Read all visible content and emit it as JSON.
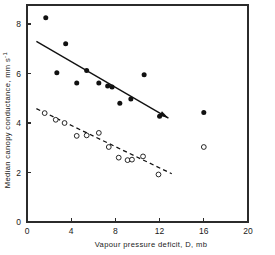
{
  "chart_data": {
    "type": "scatter",
    "title": "",
    "xlabel": "Vapour pressure deficit, D, mb",
    "ylabel": "Median canopy conductance, mm s⁻¹",
    "xlim": [
      0,
      20
    ],
    "ylim": [
      0,
      9
    ],
    "xticks": [
      0,
      4,
      8,
      12,
      16,
      20
    ],
    "xticklabels": [
      "0",
      "4",
      "8",
      "12",
      "16",
      "20"
    ],
    "yticks": [
      0,
      2,
      4,
      6,
      8
    ],
    "yticklabels": [
      "0",
      "2",
      "4",
      "6",
      "8"
    ],
    "grid": false,
    "legend": "none",
    "series": [
      {
        "name": "filled-circles",
        "marker": "filled-circle",
        "color": "#111111",
        "points": [
          {
            "x": 1.7,
            "y": 8.25
          },
          {
            "x": 2.7,
            "y": 6.03
          },
          {
            "x": 3.5,
            "y": 7.2
          },
          {
            "x": 4.5,
            "y": 5.62
          },
          {
            "x": 5.4,
            "y": 6.12
          },
          {
            "x": 6.5,
            "y": 5.62
          },
          {
            "x": 7.3,
            "y": 5.5
          },
          {
            "x": 7.7,
            "y": 5.45
          },
          {
            "x": 8.4,
            "y": 4.8
          },
          {
            "x": 9.4,
            "y": 4.97
          },
          {
            "x": 10.6,
            "y": 5.95
          },
          {
            "x": 12.0,
            "y": 4.27
          },
          {
            "x": 16.0,
            "y": 4.42
          }
        ],
        "fit_line": {
          "style": "solid",
          "x_start": 0.85,
          "y_start": 7.3,
          "x_end": 12.8,
          "y_end": 4.2
        }
      },
      {
        "name": "open-circles",
        "marker": "open-circle",
        "color": "#111111",
        "points": [
          {
            "x": 1.6,
            "y": 4.4
          },
          {
            "x": 2.6,
            "y": 4.13
          },
          {
            "x": 3.4,
            "y": 4.0
          },
          {
            "x": 4.5,
            "y": 3.48
          },
          {
            "x": 5.4,
            "y": 3.5
          },
          {
            "x": 6.5,
            "y": 3.6
          },
          {
            "x": 7.4,
            "y": 3.03
          },
          {
            "x": 8.3,
            "y": 2.6
          },
          {
            "x": 9.1,
            "y": 2.5
          },
          {
            "x": 9.5,
            "y": 2.52
          },
          {
            "x": 10.5,
            "y": 2.65
          },
          {
            "x": 11.9,
            "y": 1.92
          },
          {
            "x": 16.0,
            "y": 3.03
          }
        ],
        "fit_line": {
          "style": "dashed",
          "x_start": 0.85,
          "y_start": 4.58,
          "x_end": 13.1,
          "y_end": 1.95
        }
      }
    ],
    "axes_style": {
      "frame": "full-box",
      "tick_direction": "out",
      "axis_color": "#2b2b2b"
    }
  }
}
